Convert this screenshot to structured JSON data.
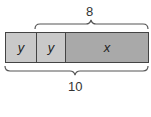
{
  "diagram": {
    "type": "tape-diagram",
    "segments": [
      {
        "label": "y",
        "color": "#c9c9c9",
        "width": 30
      },
      {
        "label": "y",
        "color": "#c9c9c9",
        "width": 29
      },
      {
        "label": "x",
        "color": "#a9a9a9",
        "width": 84
      }
    ],
    "top_brace": {
      "label": "8",
      "spans": [
        "y",
        "x"
      ]
    },
    "bottom_brace": {
      "label": "10",
      "spans": [
        "y",
        "y",
        "x"
      ]
    }
  }
}
